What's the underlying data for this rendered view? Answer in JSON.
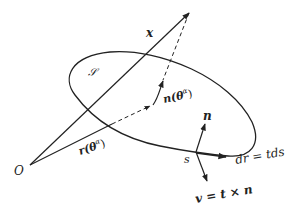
{
  "diagram": {
    "title": "",
    "stroke_color": "#222222",
    "background": "#ffffff",
    "labels": {
      "origin": "O",
      "x_vector": "x",
      "surface": "𝒮",
      "normal_at_theta": "n(θ",
      "normal_at_theta_sup": "α",
      "normal_at_theta_close": ")",
      "position_vector": "r(θ",
      "position_vector_sup": "α",
      "position_vector_close": ")",
      "normal_at_s": "n",
      "arc_point": "s",
      "tangent_element": "dr = tds",
      "conormal": "v = t × n"
    },
    "elements": [
      {
        "name": "x-vector",
        "from": "O",
        "to": "apex",
        "style": "solid-arrow"
      },
      {
        "name": "position-vector",
        "from": "O",
        "to": "surface-point",
        "style": "solid-then-dashed"
      },
      {
        "name": "apex-to-surface",
        "style": "dashed"
      },
      {
        "name": "normal-vector-at-theta",
        "style": "arrow"
      },
      {
        "name": "boundary-curve",
        "style": "closed-ellipse"
      },
      {
        "name": "normal-at-s",
        "style": "arrow"
      },
      {
        "name": "tangent-dr",
        "style": "arrow"
      },
      {
        "name": "conormal-v",
        "style": "arrow"
      }
    ]
  }
}
